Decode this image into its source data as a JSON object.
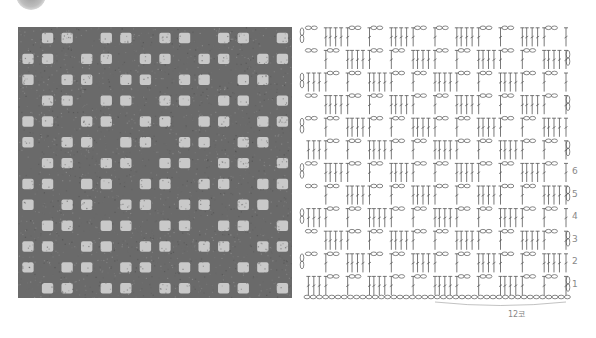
{
  "badge": {
    "icon": "round-badge-icon"
  },
  "photo": {
    "alt": "Crocheted filet swatch",
    "yarn_color": "#6a6a6a",
    "hole_color": "#c9c9c9",
    "grid_cols": 14,
    "grid_rows": 13
  },
  "chart": {
    "line_color": "#555555",
    "label_color": "#888888",
    "row_labels": [
      {
        "row": 1,
        "text": "1"
      },
      {
        "row": 2,
        "text": "2"
      },
      {
        "row": 3,
        "text": "3"
      },
      {
        "row": 4,
        "text": "4"
      },
      {
        "row": 5,
        "text": "5"
      },
      {
        "row": 6,
        "text": "6"
      }
    ],
    "repeat_label": "12코",
    "rows": [
      "BMMBMMBMMBMM",
      "MMBMMBMMBMMB",
      "MBMMBMMBMMBM",
      "BMMBMMBMMBMM",
      "MMBMMBMMBMMB",
      "MBMMBMMBMMBM",
      "BMMBMMBMMBMM",
      "MMBMMBMMBMMB",
      "MBMMBMMBMMBM",
      "BMMBMMBMMBMM",
      "MMBMMBMMBMMB",
      "MBMMBMMBMMBM"
    ]
  }
}
